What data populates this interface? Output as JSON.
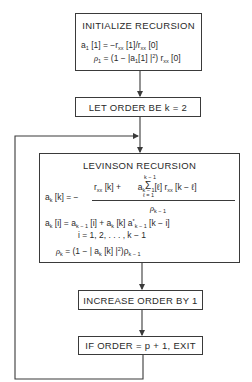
{
  "diagram": {
    "type": "flowchart",
    "boxes": {
      "init": {
        "title": "INITIALIZE RECURSION",
        "eq1": "a₁ [1] = −rₓₓ [1]/rₓₓ [0]",
        "eq2": "ρ₁ = (1 − |a₁[1]|²) rₓₓ [0]"
      },
      "let_order": {
        "title": "LET ORDER BE k = 2"
      },
      "levinson": {
        "title": "LEVINSON RECURSION",
        "eq_lhs": "a",
        "eq_lhs_sub": "k",
        "eq_lhs_rest": " [k] = −",
        "numerator_a": "r",
        "numerator_a_sub": "xx",
        "numerator_b": " [k] + ",
        "sigma": "Σ",
        "sigma_top": "k − 1",
        "sigma_bottom": "ℓ = 1",
        "numerator_c": " a",
        "numerator_c_sub": "k − 1",
        "numerator_d": "[ℓ] r",
        "numerator_d_sub": "xx",
        "numerator_e": " [k − ℓ]",
        "denominator": "ρ",
        "denominator_sub": "k − 1",
        "eq2_a": "a",
        "eq2_a_sub": "k",
        "eq2_b": " [i] = a",
        "eq2_b_sub": "k − 1",
        "eq2_c": " [i] + a",
        "eq2_c_sub": "k",
        "eq2_d": " [k] a",
        "eq2_d_sup": "*",
        "eq2_d_sub": "k − 1",
        "eq2_e": " [k − i]",
        "eq3": "i = 1, 2, . . . , k − 1",
        "eq4_a": "ρ",
        "eq4_a_sub": "k",
        "eq4_b": " = (1 − | a",
        "eq4_b_sub": "k",
        "eq4_c": " [k] |",
        "eq4_c_sup": "2",
        "eq4_d": ")ρ",
        "eq4_d_sub": "k − 1"
      },
      "increase": {
        "title": "INCREASE ORDER BY 1"
      },
      "exit": {
        "title": "IF ORDER = p + 1, EXIT"
      }
    },
    "edges": [
      {
        "from": "init",
        "to": "let_order"
      },
      {
        "from": "let_order",
        "to": "levinson"
      },
      {
        "from": "levinson",
        "to": "increase"
      },
      {
        "from": "increase",
        "to": "exit"
      },
      {
        "from": "exit",
        "to": "levinson",
        "label": "loop back"
      }
    ],
    "colors": {
      "line": "#3a3a3a",
      "text": "#2a2a2a",
      "background": "#ffffff"
    }
  }
}
